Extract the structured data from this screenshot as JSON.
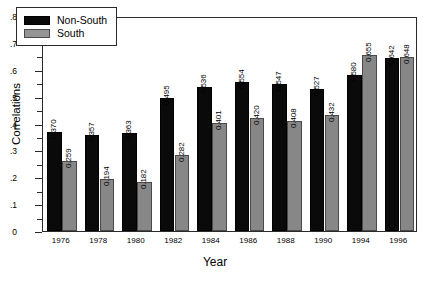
{
  "chart_data": {
    "type": "bar",
    "title": "",
    "xlabel": "Year",
    "ylabel": "Correlations",
    "categories": [
      "1976",
      "1978",
      "1980",
      "1982",
      "1984",
      "1986",
      "1988",
      "1990",
      "1994",
      "1996"
    ],
    "series": [
      {
        "name": "Non-South",
        "color": "#0a0a0a",
        "values": [
          0.37,
          0.357,
          0.363,
          0.495,
          0.536,
          0.554,
          0.547,
          0.527,
          0.58,
          0.642
        ],
        "labels": [
          "0.370",
          "0.357",
          "0.363",
          "0.495",
          "0.536",
          "0.554",
          "0.547",
          "0.527",
          "0.580",
          "0.642"
        ]
      },
      {
        "name": "South",
        "color": "#878787",
        "values": [
          0.259,
          0.194,
          0.182,
          0.282,
          0.401,
          0.42,
          0.408,
          0.432,
          0.655,
          0.648
        ],
        "labels": [
          "0.259",
          "0.194",
          "0.182",
          "0.282",
          "0.401",
          "0.420",
          "0.408",
          "0.432",
          "0.655",
          "0.648"
        ]
      }
    ],
    "ylim": [
      0,
      0.8
    ],
    "ytick_labels": [
      "0",
      ".1",
      ".2",
      ".3",
      ".4",
      ".5",
      ".6",
      ".7",
      ".8"
    ],
    "ytick_values": [
      0,
      0.1,
      0.2,
      0.3,
      0.4,
      0.5,
      0.6,
      0.7,
      0.8
    ],
    "yminor_values": [
      0.05,
      0.15,
      0.25,
      0.35,
      0.45,
      0.55,
      0.65,
      0.75
    ],
    "grid": false,
    "legend_position": "top-left",
    "legend_entries": [
      "Non-South",
      "South"
    ]
  }
}
